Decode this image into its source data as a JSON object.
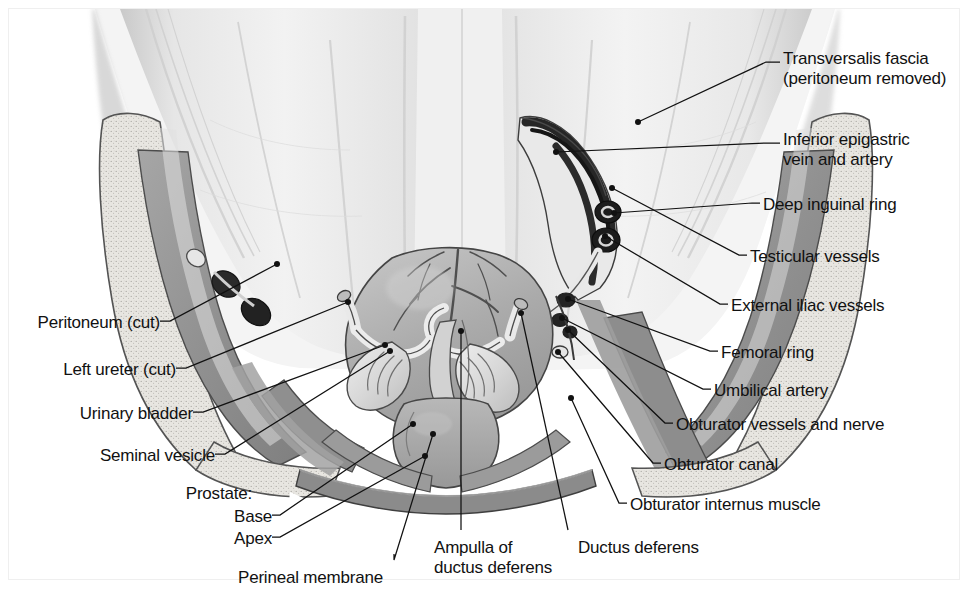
{
  "figure": {
    "kind": "anatomical-illustration",
    "background_color": "#ffffff",
    "frame_color": "#efefef",
    "line_color": "#111111",
    "text_color": "#111111",
    "palette": {
      "fascia_light": "#ededed",
      "fascia_mid": "#dedede",
      "bone_stipple": "#e4e2dd",
      "muscle_gray": "#9a9a9a",
      "muscle_dark": "#7d7d7d",
      "organ_mid": "#b3b3b3",
      "organ_light": "#cfcfcf",
      "vessel_dark": "#2b2b2b",
      "vessel_black": "#141414",
      "outline": "#3a3a3a"
    }
  },
  "labels": {
    "right": [
      {
        "id": "transversalis-fascia",
        "lines": [
          "Transversalis fascia",
          "(peritoneum removed)"
        ],
        "x": 783,
        "y": 49,
        "anchor": [
          638,
          122
        ],
        "elbow": [
          766,
          62
        ]
      },
      {
        "id": "inferior-epigastric",
        "lines": [
          "Inferior epigastric",
          "vein and artery"
        ],
        "x": 783,
        "y": 130,
        "anchor": [
          556,
          152
        ],
        "elbow": [
          766,
          143
        ]
      },
      {
        "id": "deep-inguinal-ring",
        "lines": [
          "Deep inguinal ring"
        ],
        "x": 763,
        "y": 195,
        "anchor": [
          614,
          213
        ],
        "elbow": [
          752,
          203
        ]
      },
      {
        "id": "testicular-vessels",
        "lines": [
          "Testicular vessels"
        ],
        "x": 750,
        "y": 247,
        "anchor": [
          612,
          188
        ],
        "elbow": [
          739,
          255
        ]
      },
      {
        "id": "external-iliac-vessels",
        "lines": [
          "External iliac vessels"
        ],
        "x": 731,
        "y": 296,
        "anchor": [
          605,
          236
        ],
        "elbow": [
          720,
          304
        ]
      },
      {
        "id": "femoral-ring",
        "lines": [
          "Femoral ring"
        ],
        "x": 721,
        "y": 343,
        "anchor": [
          568,
          299
        ],
        "elbow": [
          710,
          351
        ]
      },
      {
        "id": "umbilical-artery",
        "lines": [
          "Umbilical artery"
        ],
        "x": 714,
        "y": 381,
        "anchor": [
          562,
          318
        ],
        "elbow": [
          703,
          389
        ]
      },
      {
        "id": "obturator-vessels-and-nerve",
        "lines": [
          "Obturator vessels and nerve"
        ],
        "x": 676,
        "y": 415,
        "anchor": [
          568,
          330
        ],
        "elbow": [
          665,
          423
        ]
      },
      {
        "id": "obturator-canal",
        "lines": [
          "Obturator canal"
        ],
        "x": 664,
        "y": 455,
        "anchor": [
          558,
          352
        ],
        "elbow": [
          653,
          463
        ]
      },
      {
        "id": "obturator-internus-muscle",
        "lines": [
          "Obturator internus muscle"
        ],
        "x": 630,
        "y": 495,
        "anchor": [
          571,
          398
        ],
        "elbow": [
          619,
          503
        ]
      }
    ],
    "left": [
      {
        "id": "peritoneum-cut",
        "lines": [
          "Peritoneum (cut)"
        ],
        "x": 24,
        "y": 313,
        "anchor": [
          277,
          264
        ],
        "elbow": [
          170,
          321
        ]
      },
      {
        "id": "left-ureter-cut",
        "lines": [
          "Left ureter (cut)"
        ],
        "x": 40,
        "y": 360,
        "anchor": [
          348,
          302
        ],
        "elbow": [
          186,
          368
        ]
      },
      {
        "id": "urinary-bladder",
        "lines": [
          "Urinary bladder"
        ],
        "x": 57,
        "y": 404,
        "anchor": [
          385,
          345
        ],
        "elbow": [
          203,
          412
        ]
      },
      {
        "id": "seminal-vesicle",
        "lines": [
          "Seminal vesicle"
        ],
        "x": 79,
        "y": 446,
        "anchor": [
          390,
          351
        ],
        "elbow": [
          225,
          454
        ]
      },
      {
        "id": "prostate",
        "lines": [
          "Prostate:"
        ],
        "x": 176,
        "y": 484,
        "anchor": null,
        "elbow": null
      },
      {
        "id": "prostate-base",
        "lines": [
          "Base"
        ],
        "x": 229,
        "y": 507,
        "anchor": [
          413,
          424
        ],
        "elbow": [
          280,
          515
        ]
      },
      {
        "id": "prostate-apex",
        "lines": [
          "Apex"
        ],
        "x": 229,
        "y": 529,
        "anchor": [
          425,
          456
        ],
        "elbow": [
          280,
          537
        ]
      },
      {
        "id": "perineal-membrane",
        "lines": [
          "Perineal membrane"
        ],
        "x": 238,
        "y": 568,
        "anchor": [
          433,
          434
        ],
        "elbow": [
          394,
          560
        ]
      }
    ],
    "bottom": [
      {
        "id": "ampulla-of-ductus-deferens",
        "lines": [
          "Ampulla of",
          "ductus deferens"
        ],
        "x": 434,
        "y": 538,
        "anchor": [
          461,
          331
        ],
        "elbow": [
          461,
          530
        ]
      },
      {
        "id": "ductus-deferens",
        "lines": [
          "Ductus deferens"
        ],
        "x": 578,
        "y": 538,
        "anchor": [
          521,
          313
        ],
        "elbow": [
          568,
          530
        ]
      }
    ]
  }
}
